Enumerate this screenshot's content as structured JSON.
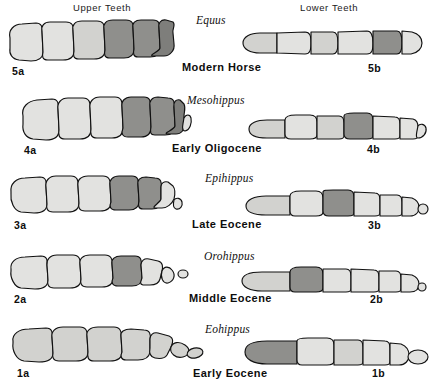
{
  "figure": {
    "headers": {
      "upper": "Upper  Teeth",
      "lower": "Lower  Teeth"
    },
    "rows": [
      {
        "key": "row5",
        "genus": "Equus",
        "epoch": "Modern Horse",
        "upper_label": "5a",
        "lower_label": "5b",
        "upper_teeth_count": 6,
        "lower_teeth_count": 6,
        "upper_shading": [
          "light",
          "light",
          "light",
          "dark",
          "dark",
          "dark"
        ],
        "lower_shading": [
          "light",
          "light",
          "light",
          "light",
          "dark",
          "light"
        ]
      },
      {
        "key": "row4",
        "genus": "Mesohippus",
        "epoch": "Early  Oligocene",
        "upper_label": "4a",
        "lower_label": "4b",
        "upper_teeth_count": 7,
        "lower_teeth_count": 7,
        "upper_shading": [
          "light",
          "light",
          "light",
          "dark",
          "dark",
          "dark",
          "light"
        ],
        "lower_shading": [
          "light",
          "light",
          "light",
          "dark",
          "light",
          "light",
          "light"
        ]
      },
      {
        "key": "row3",
        "genus": "Epihippus",
        "epoch": "Late  Eocene",
        "upper_label": "3a",
        "lower_label": "3b",
        "upper_teeth_count": 7,
        "lower_teeth_count": 7,
        "upper_shading": [
          "light",
          "light",
          "light",
          "dark",
          "dark",
          "light",
          "light"
        ],
        "lower_shading": [
          "light",
          "light",
          "dark",
          "light",
          "light",
          "light",
          "light"
        ]
      },
      {
        "key": "row2",
        "genus": "Orohippus",
        "epoch": "Middle  Eocene",
        "upper_label": "2a",
        "lower_label": "2b",
        "upper_teeth_count": 7,
        "lower_teeth_count": 7,
        "upper_shading": [
          "light",
          "light",
          "light",
          "dark",
          "light",
          "light",
          "light"
        ],
        "lower_shading": [
          "light",
          "dark",
          "light",
          "light",
          "light",
          "light",
          "light"
        ]
      },
      {
        "key": "row1",
        "genus": "Eohippus",
        "epoch": "Early  Eocene",
        "upper_label": "1a",
        "lower_label": "1b",
        "upper_teeth_count": 7,
        "lower_teeth_count": 6,
        "upper_shading": [
          "light",
          "light",
          "light",
          "light",
          "light",
          "light",
          "light"
        ],
        "lower_shading": [
          "dark",
          "light",
          "light",
          "light",
          "light",
          "light"
        ]
      }
    ],
    "colors": {
      "background": "#ffffff",
      "outline": "#111111",
      "tooth_light": "#e2e2e0",
      "tooth_mid": "#d2d2cf",
      "tooth_dark": "#8f8f8c",
      "text": "#111111"
    }
  }
}
